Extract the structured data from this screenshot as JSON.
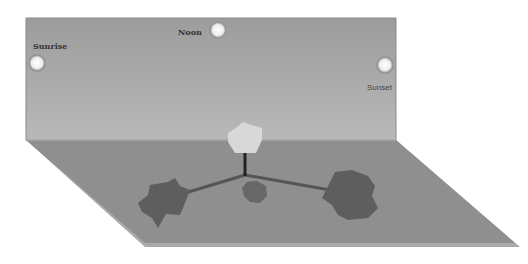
{
  "diagram": {
    "title": "",
    "labels": {
      "sunrise": "Sunrise",
      "noon": "Noon",
      "sunset": "Sunset"
    },
    "elements": {
      "back_wall": "sky backdrop",
      "floor": "ground plane",
      "suns": [
        "sunrise-sun",
        "noon-sun",
        "sunset-sun"
      ],
      "shadows": [
        "left-long-shadow",
        "short-noon-shadow",
        "right-long-shadow"
      ],
      "object": "light pentagon-shaped object on a pole"
    },
    "colors": {
      "wall_top": "#9a9a9a",
      "wall_bottom": "#b8b8b8",
      "floor": "#8e8e8e",
      "floor_edge": "#b0b0b0",
      "shadow": "#5a5a5a",
      "object": "#d6d6d6",
      "sun": "#f2f2f2"
    }
  }
}
